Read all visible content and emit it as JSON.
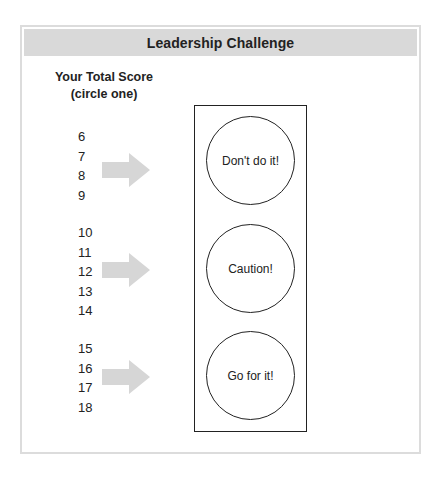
{
  "title": "Leadership Challenge",
  "score_header": {
    "line1": "Your Total Score",
    "line2": "(circle one)"
  },
  "groups": [
    {
      "scores": [
        "6",
        "7",
        "8",
        "9"
      ],
      "result": "Don't do it!"
    },
    {
      "scores": [
        "10",
        "11",
        "12",
        "13",
        "14"
      ],
      "result": "Caution!"
    },
    {
      "scores": [
        "15",
        "16",
        "17",
        "18"
      ],
      "result": "Go for it!"
    }
  ],
  "colors": {
    "header_bg": "#d9d9d9",
    "arrow": "#d6d6d6",
    "border": "#222222"
  }
}
